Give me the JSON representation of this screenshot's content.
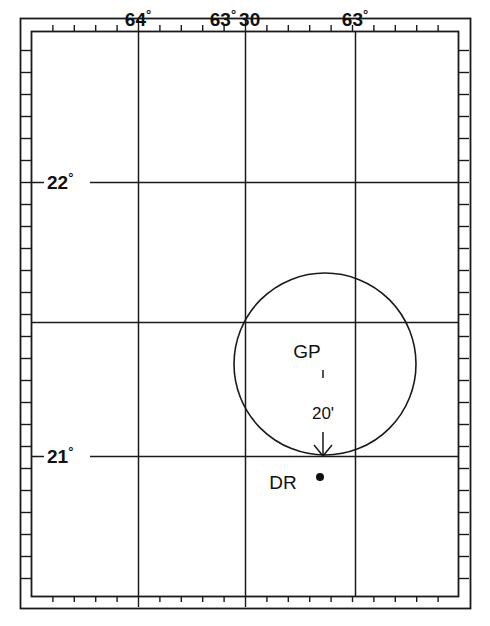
{
  "chart": {
    "background_color": "#ffffff",
    "line_color": "#1a1a1a",
    "frame": {
      "outer": {
        "x": 20,
        "y": 18,
        "width": 450,
        "height": 590
      },
      "neatline": {
        "x": 31,
        "y": 31,
        "width": 427,
        "height": 565
      },
      "tick_band_px": 11
    },
    "longitude": {
      "axis_name": "longitude",
      "label_position": "top",
      "labels": [
        {
          "text": "64",
          "degree_symbol": "°",
          "suffix": "",
          "value": 64.0,
          "x": 138
        },
        {
          "text": "63",
          "degree_symbol": "°",
          "suffix": "30",
          "value": 63.5,
          "x": 245
        },
        {
          "text": "63",
          "degree_symbol": "°",
          "suffix": "",
          "value": 63.0,
          "x": 355
        }
      ],
      "gridlines_x": [
        138,
        245,
        355
      ],
      "minute_tick_spacing_px": 21.4
    },
    "latitude": {
      "axis_name": "latitude",
      "label_position": "left",
      "labels": [
        {
          "text": "22",
          "degree_symbol": "°",
          "value": 22.0,
          "y": 182
        },
        {
          "text": "21",
          "degree_symbol": "°",
          "value": 21.0,
          "y": 456
        }
      ],
      "gridlines_y": [
        182,
        322,
        456
      ],
      "unlabeled_gridlines_y": [
        322
      ],
      "minute_tick_spacing_px": 22.0
    },
    "circle_of_position": {
      "name": "circle-of-equal-altitude",
      "center_x": 325,
      "center_y": 364,
      "radius": 91,
      "stroke_width": 1.6
    },
    "markers": [
      {
        "id": "gp",
        "label": "GP",
        "label_x": 307,
        "label_y": 358,
        "description": "Geographical Position"
      },
      {
        "id": "dr",
        "label": "DR",
        "label_x": 283,
        "label_y": 489,
        "dot_x": 320,
        "dot_y": 477,
        "dot_radius": 4,
        "description": "Dead Reckoning position"
      }
    ],
    "arrow": {
      "name": "intercept-arrow",
      "x1": 323,
      "y1": 370,
      "x2": 323,
      "y2": 456,
      "gap_top": 378,
      "gap_bottom": 432,
      "label": "20'",
      "label_x": 323,
      "label_y": 419,
      "head_width": 9,
      "head_length": 11
    }
  }
}
